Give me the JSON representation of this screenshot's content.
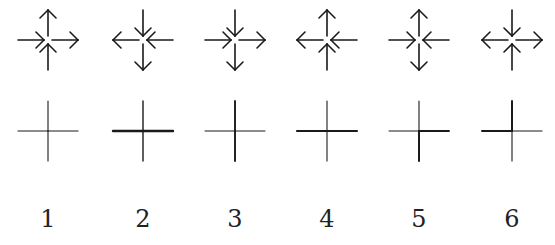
{
  "figures": [
    {
      "label": "1",
      "cx": 48,
      "arrows": {
        "top": "out",
        "bottom": "in",
        "left": "in",
        "right": "out"
      },
      "cross": {
        "top": 1.1,
        "bottom": 1.1,
        "left": 1.1,
        "right": 1.1
      }
    },
    {
      "label": "2",
      "cx": 143,
      "arrows": {
        "top": "in",
        "bottom": "out",
        "left": "out",
        "right": "in"
      },
      "cross": {
        "top": 1.4,
        "bottom": 1.4,
        "left": 2.4,
        "right": 2.4
      }
    },
    {
      "label": "3",
      "cx": 235,
      "arrows": {
        "top": "in",
        "bottom": "out",
        "left": "in",
        "right": "out"
      },
      "cross": {
        "top": 1.9,
        "bottom": 1.9,
        "left": 1.1,
        "right": 1.1
      }
    },
    {
      "label": "4",
      "cx": 327,
      "arrows": {
        "top": "out",
        "bottom": "in",
        "left": "out",
        "right": "in"
      },
      "cross": {
        "top": 1.1,
        "bottom": 1.1,
        "left": 2.2,
        "right": 2.2
      }
    },
    {
      "label": "5",
      "cx": 419,
      "arrows": {
        "top": "out",
        "bottom": "out",
        "left": "in",
        "right": "in"
      },
      "cross": {
        "top": 1.1,
        "bottom": 2.0,
        "left": 1.1,
        "right": 1.9
      }
    },
    {
      "label": "6",
      "cx": 512,
      "arrows": {
        "top": "in",
        "bottom": "in",
        "left": "out",
        "right": "out"
      },
      "cross": {
        "top": 2.0,
        "bottom": 1.1,
        "left": 2.0,
        "right": 1.1
      }
    }
  ],
  "layout": {
    "arrow_cy": 40,
    "cross_cy": 131,
    "arrow_len": 30,
    "cross_len": 30
  },
  "colors": {
    "stroke": "#1a1a1a"
  }
}
